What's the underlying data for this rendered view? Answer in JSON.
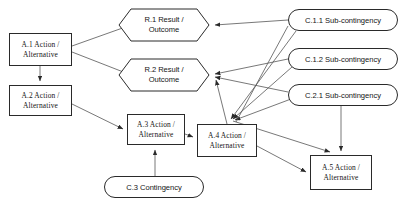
{
  "diagram": {
    "canvas": {
      "width": 398,
      "height": 209
    },
    "colors": {
      "background": "#ffffff",
      "stroke": "#2a2a2a",
      "text": "#151515",
      "edge": "#555555"
    },
    "nodes": [
      {
        "id": "a1",
        "shape": "rect",
        "label": "A.1 Action /\nAlternative",
        "line1": "A.1 Action /",
        "line2": "Alternative",
        "x": 9,
        "y": 33,
        "w": 63,
        "h": 33
      },
      {
        "id": "a2",
        "shape": "rect",
        "label": "A.2 Action /\nAlternative",
        "line1": "A.2 Action /",
        "line2": "Alternative",
        "x": 9,
        "y": 85,
        "w": 63,
        "h": 31
      },
      {
        "id": "a3",
        "shape": "rect",
        "label": "A.3 Action /\nAlternative",
        "line1": "A.3 Action /",
        "line2": "Alternative",
        "x": 127,
        "y": 114,
        "w": 58,
        "h": 31
      },
      {
        "id": "a4",
        "shape": "rect",
        "label": "A.4 Action /\nAlternative",
        "line1": "A.4 Action /",
        "line2": "Alternative",
        "x": 197,
        "y": 124,
        "w": 60,
        "h": 33
      },
      {
        "id": "a5",
        "shape": "rect",
        "label": "A.5 Action /\nAlternative",
        "line1": "A.5 Action /",
        "line2": "Alternative",
        "x": 310,
        "y": 155,
        "w": 62,
        "h": 35
      },
      {
        "id": "r1",
        "shape": "hexagon",
        "label": "R.1 Result /\nOutcome",
        "line1": "R.1 Result /",
        "line2": "Outcome",
        "x": 118,
        "y": 8,
        "w": 92,
        "h": 34
      },
      {
        "id": "r2",
        "shape": "hexagon",
        "label": "R.2 Result /\nOutcome",
        "line1": "R.2 Result /",
        "line2": "Outcome",
        "x": 118,
        "y": 58,
        "w": 92,
        "h": 34
      },
      {
        "id": "c11",
        "shape": "pill",
        "label": "C.1.1 Sub-contingency",
        "x": 288,
        "y": 9,
        "w": 110,
        "h": 22
      },
      {
        "id": "c12",
        "shape": "pill",
        "label": "C.1.2 Sub-contingency",
        "x": 288,
        "y": 48,
        "w": 110,
        "h": 22
      },
      {
        "id": "c21",
        "shape": "pill",
        "label": "C.2.1 Sub-contingency",
        "x": 288,
        "y": 84,
        "w": 110,
        "h": 22
      },
      {
        "id": "c3",
        "shape": "pill",
        "label": "C.3 Contingency",
        "x": 104,
        "y": 176,
        "w": 100,
        "h": 22
      }
    ],
    "edges": [
      {
        "from": "a1",
        "to": "r1",
        "arrow": "filled"
      },
      {
        "from": "a1",
        "to": "r2",
        "arrow": "filled"
      },
      {
        "from": "a1",
        "to": "a2",
        "arrow": "filled"
      },
      {
        "from": "a2",
        "to": "a3",
        "arrow": "filled"
      },
      {
        "from": "a3",
        "to": "a4",
        "arrow": "filled"
      },
      {
        "from": "c3",
        "to": "a3",
        "arrow": "filled"
      },
      {
        "from": "c11",
        "to": "r1",
        "arrow": "filled"
      },
      {
        "from": "c11",
        "to": "a4",
        "arrow": "filled"
      },
      {
        "from": "c12",
        "to": "r2",
        "arrow": "filled"
      },
      {
        "from": "c12",
        "to": "a4",
        "arrow": "filled"
      },
      {
        "from": "c21",
        "to": "r2",
        "arrow": "filled"
      },
      {
        "from": "c21",
        "to": "a4",
        "arrow": "filled"
      },
      {
        "from": "c21",
        "to": "a5",
        "arrow": "filled"
      },
      {
        "from": "a4",
        "to": "r2",
        "arrow": "filled"
      },
      {
        "from": "a4",
        "to": "a5",
        "arrow": "filled"
      },
      {
        "from": "c3",
        "to": "a5",
        "arrow": "filled"
      }
    ]
  }
}
